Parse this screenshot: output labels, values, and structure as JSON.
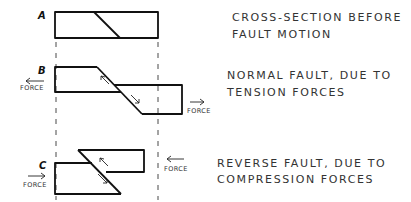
{
  "diagram": {
    "panels": [
      {
        "letter": "A",
        "caption_line1": "CROSS-SECTION  BEFORE",
        "caption_line2": "FAULT  MOTION"
      },
      {
        "letter": "B",
        "caption_line1": "NORMAL  FAULT, DUE  TO",
        "caption_line2": "TENSION  FORCES",
        "force_left": "FORCE",
        "force_right": "FORCE"
      },
      {
        "letter": "C",
        "caption_line1": "REVERSE  FAULT,  DUE  TO",
        "caption_line2": "COMPRESSION   FORCES",
        "force_left": "FORCE",
        "force_right": "FORCE"
      }
    ],
    "colors": {
      "ink": "#111111",
      "background": "#ffffff"
    }
  }
}
